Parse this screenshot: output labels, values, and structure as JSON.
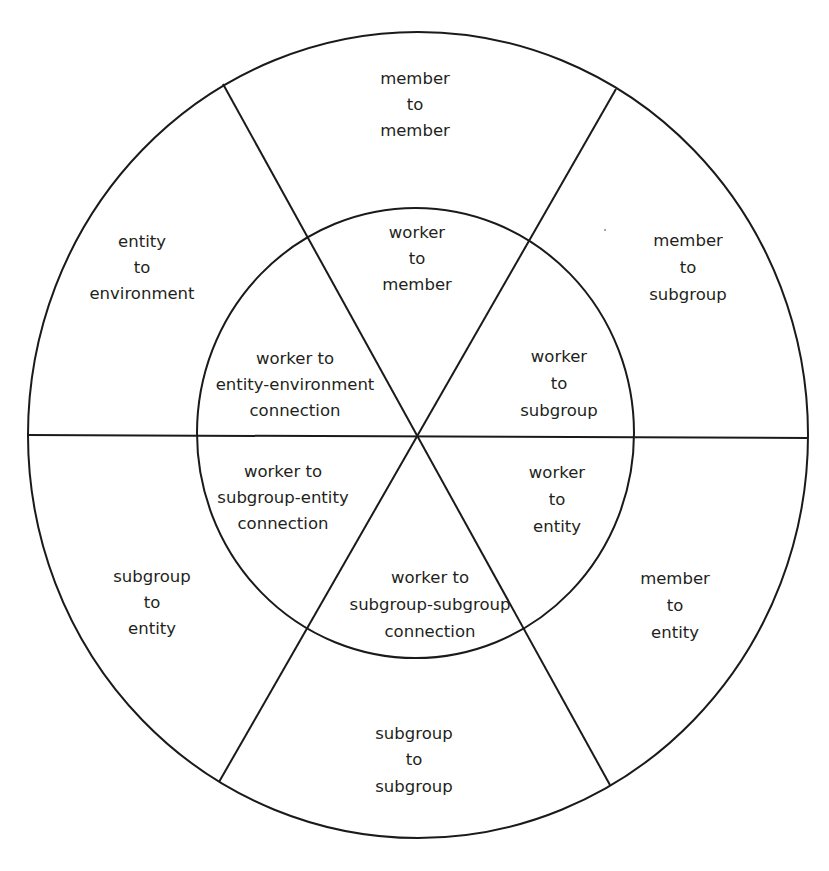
{
  "diagram": {
    "type": "concentric-wheel",
    "line_color": "#1a1a1a",
    "text_color": "#231f20",
    "background": "#ffffff",
    "outer_ring": [
      {
        "id": "member-to-member",
        "lines": [
          "member",
          "to",
          "member"
        ]
      },
      {
        "id": "member-to-subgroup",
        "lines": [
          "member",
          "to",
          "subgroup"
        ]
      },
      {
        "id": "member-to-entity",
        "lines": [
          "member",
          "to",
          "entity"
        ]
      },
      {
        "id": "subgroup-to-subgroup",
        "lines": [
          "subgroup",
          "to",
          "subgroup"
        ]
      },
      {
        "id": "subgroup-to-entity",
        "lines": [
          "subgroup",
          "to",
          "entity"
        ]
      },
      {
        "id": "entity-to-environment",
        "lines": [
          "entity",
          "to",
          "environment"
        ]
      }
    ],
    "inner_circle": [
      {
        "id": "worker-to-member",
        "lines": [
          "worker",
          "to",
          "member"
        ]
      },
      {
        "id": "worker-to-subgroup",
        "lines": [
          "worker",
          "to",
          "subgroup"
        ]
      },
      {
        "id": "worker-to-entity",
        "lines": [
          "worker",
          "to",
          "entity"
        ]
      },
      {
        "id": "worker-to-subgroup-subgroup-connection",
        "lines": [
          "worker to",
          "subgroup-subgroup",
          "connection"
        ]
      },
      {
        "id": "worker-to-subgroup-entity-connection",
        "lines": [
          "worker to",
          "subgroup-entity",
          "connection"
        ]
      },
      {
        "id": "worker-to-entity-environment-connection",
        "lines": [
          "worker to",
          "entity-environment",
          "connection"
        ]
      }
    ]
  }
}
